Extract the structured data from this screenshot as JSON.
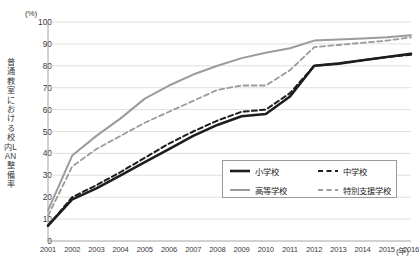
{
  "axes": {
    "y_unit": "(%)",
    "x_unit": "(年)",
    "y_title": "普通教室における校内LAN整備率",
    "y_ticks": [
      "100",
      "90",
      "80",
      "70",
      "60",
      "50",
      "40",
      "30",
      "20",
      "10",
      "0"
    ],
    "x_ticks": [
      "2001",
      "2002",
      "2003",
      "2004",
      "2005",
      "2006",
      "2007",
      "2008",
      "2009",
      "2010",
      "2011",
      "2012",
      "2013",
      "2014",
      "2015",
      "2016"
    ]
  },
  "legend": {
    "items": [
      {
        "label": "小学校",
        "color": "#1d1d1d",
        "style": "solid",
        "width": 2.6
      },
      {
        "label": "中学校",
        "color": "#1d1d1d",
        "style": "dashed",
        "width": 2.0
      },
      {
        "label": "高等学校",
        "color": "#9b9b9b",
        "style": "solid",
        "width": 2.0
      },
      {
        "label": "特別支援学校",
        "color": "#9b9b9b",
        "style": "dashed",
        "width": 1.8
      }
    ]
  },
  "colors": {
    "black": "#1d1d1d",
    "gray": "#9b9b9b",
    "grid": "#d8d8d8",
    "axis": "#9a9a9a",
    "text": "#3a3a3a"
  },
  "chart_data": {
    "type": "line",
    "title": "",
    "xlabel": "(年)",
    "ylabel": "普通教室における校内LAN整備率 (%)",
    "xlim": [
      2001,
      2016
    ],
    "ylim": [
      0,
      100
    ],
    "ytick_step": 10,
    "grid": true,
    "legend_position": "inside-bottom-right",
    "x": [
      2001,
      2002,
      2003,
      2004,
      2005,
      2006,
      2007,
      2008,
      2009,
      2010,
      2011,
      2012,
      2013,
      2014,
      2015,
      2016
    ],
    "series": [
      {
        "name": "小学校",
        "color": "#1d1d1d",
        "style": "solid",
        "values": [
          7,
          19,
          24,
          30,
          36,
          42,
          48,
          53,
          57,
          58,
          66,
          80,
          81,
          82.5,
          84,
          85.5
        ]
      },
      {
        "name": "中学校",
        "color": "#1d1d1d",
        "style": "dashed",
        "values": [
          7,
          20,
          25.5,
          31.5,
          38,
          44.5,
          50,
          55,
          59,
          60,
          67.5,
          80,
          81,
          82.5,
          84,
          85
        ]
      },
      {
        "name": "高等学校",
        "color": "#9b9b9b",
        "style": "solid",
        "values": [
          14,
          39,
          48,
          56,
          65,
          71,
          76,
          80,
          83.5,
          86,
          88,
          91.5,
          92,
          92.5,
          93,
          94
        ]
      },
      {
        "name": "特別支援学校",
        "color": "#9b9b9b",
        "style": "dashed",
        "values": [
          11.5,
          34,
          42,
          48,
          54,
          59,
          64,
          69,
          71,
          71,
          78,
          88.5,
          89.5,
          90.5,
          91.5,
          93
        ]
      }
    ]
  }
}
